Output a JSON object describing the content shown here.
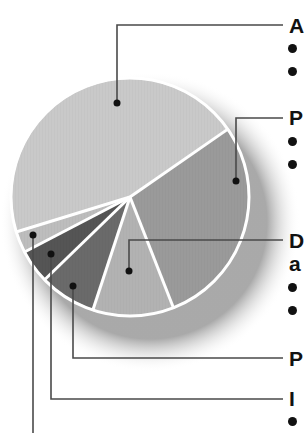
{
  "chart_data": {
    "type": "pie",
    "title": "",
    "note": "Labels are cropped at right edge of image; only first letters visible",
    "start_angle_deg": 162.9,
    "direction": "clockwise",
    "slices": [
      {
        "label": "A",
        "value": 45.1,
        "color": "#c9c9c9",
        "bullets": 2
      },
      {
        "label": "P",
        "value": 28.7,
        "color": "#9a9a9a",
        "bullets": 2
      },
      {
        "label": "D a",
        "value": 11.0,
        "color": "#b2b2b2",
        "bullets": 2
      },
      {
        "label": "P",
        "value": 7.7,
        "color": "#6a6a6a",
        "bullets": 0
      },
      {
        "label": "I",
        "value": 4.6,
        "color": "#555555",
        "bullets": 1
      },
      {
        "label": "",
        "value": 2.9,
        "color": "#bdbdbd",
        "bullets": 0
      }
    ],
    "legend_position": "right, with leader lines",
    "grid": false
  },
  "labels": {
    "a": "A",
    "p1": "P",
    "d_line1": "D",
    "d_line2": "a",
    "p2": "P",
    "i": "I"
  },
  "colors": {
    "leader": "#4a4a4a",
    "separator": "#ffffff",
    "shadow": "#bdbdbd"
  }
}
